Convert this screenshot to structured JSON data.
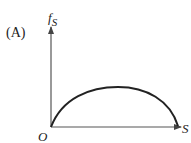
{
  "panel_label": "(A)",
  "y_axis": {
    "label_main": "f",
    "label_sub": "S"
  },
  "x_axis": {
    "label": "S"
  },
  "origin_label": "O",
  "curve": {
    "description": "concave-down arc starting at origin, peaking mid-range, returning to the S axis at the right end"
  },
  "colors": {
    "ink": "#222222",
    "axis": "#555555"
  }
}
